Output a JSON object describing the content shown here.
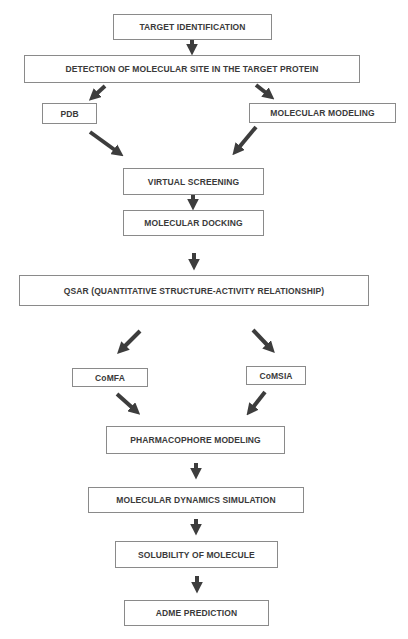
{
  "diagram": {
    "type": "flowchart",
    "nodes": [
      {
        "id": "target_identification",
        "label": "TARGET IDENTIFICATION"
      },
      {
        "id": "detection",
        "label": "DETECTION OF MOLECULAR SITE IN THE TARGET PROTEIN"
      },
      {
        "id": "pdb",
        "label": "PDB"
      },
      {
        "id": "molecular_modeling",
        "label": "MOLECULAR MODELING"
      },
      {
        "id": "virtual_screening",
        "label": "VIRTUAL SCREENING"
      },
      {
        "id": "molecular_docking",
        "label": "MOLECULAR DOCKING"
      },
      {
        "id": "qsar",
        "label": "QSAR (QUANTITATIVE STRUCTURE-ACTIVITY RELATIONSHIP)"
      },
      {
        "id": "comfa",
        "label": "CoMFA"
      },
      {
        "id": "comsia",
        "label": "CoMSIA"
      },
      {
        "id": "pharmacophore",
        "label": "PHARMACOPHORE MODELING"
      },
      {
        "id": "md_simulation",
        "label": "MOLECULAR DYNAMICS SIMULATION"
      },
      {
        "id": "solubility",
        "label": "SOLUBILITY OF MOLECULE"
      },
      {
        "id": "adme",
        "label": "ADME PREDICTION"
      }
    ],
    "edges": [
      [
        "target_identification",
        "detection"
      ],
      [
        "detection",
        "pdb"
      ],
      [
        "detection",
        "molecular_modeling"
      ],
      [
        "pdb",
        "virtual_screening"
      ],
      [
        "molecular_modeling",
        "virtual_screening"
      ],
      [
        "virtual_screening",
        "molecular_docking"
      ],
      [
        "molecular_docking",
        "qsar"
      ],
      [
        "qsar",
        "comfa"
      ],
      [
        "qsar",
        "comsia"
      ],
      [
        "comfa",
        "pharmacophore"
      ],
      [
        "comsia",
        "pharmacophore"
      ],
      [
        "pharmacophore",
        "md_simulation"
      ],
      [
        "md_simulation",
        "solubility"
      ],
      [
        "solubility",
        "adme"
      ]
    ],
    "colors": {
      "arrow": "#3d3d3d",
      "border": "#8a8a8a",
      "text": "#3a3a3a",
      "background": "#ffffff"
    }
  }
}
